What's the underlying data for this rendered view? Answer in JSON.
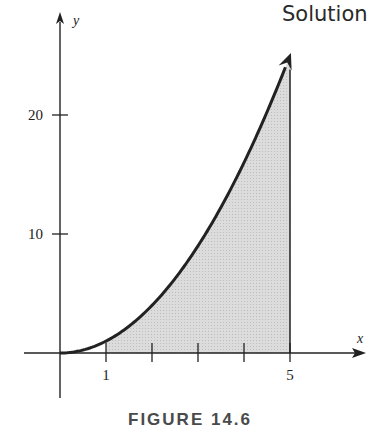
{
  "header": {
    "title": "Solution"
  },
  "figure": {
    "caption": "FIGURE 14.6"
  },
  "chart_data": {
    "type": "area",
    "title": "",
    "function": "y = x^2",
    "xlabel": "x",
    "ylabel": "y",
    "x_ticks": [
      1,
      2,
      3,
      4,
      5
    ],
    "x_tick_labels": [
      "1",
      "",
      "",
      "",
      "5"
    ],
    "y_ticks": [
      10,
      20
    ],
    "y_tick_labels": [
      "10",
      "20"
    ],
    "shaded_region": {
      "from": 1,
      "to": 5,
      "under": "y = x^2",
      "color": "#d9d9d9"
    },
    "curve_points": [
      {
        "x": 0,
        "y": 0
      },
      {
        "x": 1,
        "y": 1
      },
      {
        "x": 2,
        "y": 4
      },
      {
        "x": 3,
        "y": 9
      },
      {
        "x": 4,
        "y": 16
      },
      {
        "x": 5,
        "y": 25
      }
    ],
    "xlim": [
      -0.3,
      6.3
    ],
    "ylim": [
      -4,
      27
    ],
    "grid": false,
    "legend": "none"
  },
  "colors": {
    "ink": "#222222",
    "shade": "#d9d9d9"
  }
}
